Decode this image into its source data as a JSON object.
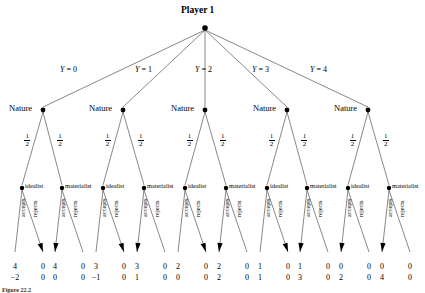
{
  "figure": {
    "title": "Player 1",
    "caption": "Figure 22.2",
    "nature_label": "Nature",
    "probability": {
      "numerator": "1",
      "denominator": "2"
    },
    "root_branch_labels": [
      "Y = 0",
      "Y = 1",
      "Y = 2",
      "Y = 3",
      "Y = 4"
    ],
    "type_labels": [
      "idealist",
      "materialist"
    ],
    "action_labels": [
      "accepts",
      "rejects"
    ],
    "colors": {
      "line": "#555555",
      "node": "#000000",
      "text": "#000000"
    }
  },
  "chart_data": {
    "type": "diagram",
    "title": "Player 1",
    "root": {
      "player": "Player 1",
      "x": 205,
      "y": 28
    },
    "root_branches": [
      {
        "label": "Y = 0",
        "value": 0,
        "child_x": 43
      },
      {
        "label": "Y = 1",
        "value": 1,
        "child_x": 123
      },
      {
        "label": "Y = 2",
        "value": 2,
        "child_x": 205
      },
      {
        "label": "Y = 3",
        "value": 3,
        "child_x": 287
      },
      {
        "label": "Y = 4",
        "value": 4,
        "child_x": 368
      }
    ],
    "nature_nodes": [
      {
        "x": 43,
        "y": 110,
        "children_x": [
          22,
          62
        ]
      },
      {
        "x": 123,
        "y": 110,
        "children_x": [
          103,
          144
        ]
      },
      {
        "x": 205,
        "y": 110,
        "children_x": [
          185,
          226
        ]
      },
      {
        "x": 287,
        "y": 110,
        "children_x": [
          267,
          307
        ]
      },
      {
        "x": 368,
        "y": 110,
        "children_x": [
          348,
          389
        ]
      }
    ],
    "decision_nodes": [
      {
        "x": 22,
        "y": 188,
        "type": "idealist",
        "arrow_on": "rejects"
      },
      {
        "x": 62,
        "y": 188,
        "type": "materialist",
        "arrow_on": "accepts"
      },
      {
        "x": 103,
        "y": 188,
        "type": "idealist",
        "arrow_on": "rejects"
      },
      {
        "x": 144,
        "y": 188,
        "type": "materialist",
        "arrow_on": "accepts"
      },
      {
        "x": 185,
        "y": 188,
        "type": "idealist",
        "arrow_on": "rejects"
      },
      {
        "x": 226,
        "y": 188,
        "type": "materialist",
        "arrow_on": "accepts"
      },
      {
        "x": 267,
        "y": 188,
        "type": "idealist",
        "arrow_on": "rejects"
      },
      {
        "x": 307,
        "y": 188,
        "type": "materialist",
        "arrow_on": "accepts"
      },
      {
        "x": 348,
        "y": 188,
        "type": "idealist",
        "arrow_on": "accepts"
      },
      {
        "x": 389,
        "y": 188,
        "type": "materialist",
        "arrow_on": "accepts"
      }
    ],
    "terminal_payoffs": [
      {
        "x": 8,
        "top": "4",
        "bottom": "−2",
        "action": "accepts",
        "type": "idealist",
        "Y": 0
      },
      {
        "x": 36,
        "top": "0",
        "bottom": "0",
        "action": "rejects",
        "type": "idealist",
        "Y": 0
      },
      {
        "x": 48,
        "top": "4",
        "bottom": "0",
        "action": "accepts",
        "type": "materialist",
        "Y": 0
      },
      {
        "x": 76,
        "top": "0",
        "bottom": "0",
        "action": "rejects",
        "type": "materialist",
        "Y": 0
      },
      {
        "x": 89,
        "top": "3",
        "bottom": "−1",
        "action": "accepts",
        "type": "idealist",
        "Y": 1
      },
      {
        "x": 117,
        "top": "0",
        "bottom": "0",
        "action": "rejects",
        "type": "idealist",
        "Y": 1
      },
      {
        "x": 130,
        "top": "3",
        "bottom": "1",
        "action": "accepts",
        "type": "materialist",
        "Y": 1
      },
      {
        "x": 158,
        "top": "0",
        "bottom": "0",
        "action": "rejects",
        "type": "materialist",
        "Y": 1
      },
      {
        "x": 171,
        "top": "2",
        "bottom": "0",
        "action": "accepts",
        "type": "idealist",
        "Y": 2
      },
      {
        "x": 199,
        "top": "0",
        "bottom": "0",
        "action": "rejects",
        "type": "idealist",
        "Y": 2
      },
      {
        "x": 212,
        "top": "2",
        "bottom": "2",
        "action": "accepts",
        "type": "materialist",
        "Y": 2
      },
      {
        "x": 240,
        "top": "0",
        "bottom": "0",
        "action": "rejects",
        "type": "materialist",
        "Y": 2
      },
      {
        "x": 253,
        "top": "1",
        "bottom": "1",
        "action": "accepts",
        "type": "idealist",
        "Y": 3
      },
      {
        "x": 281,
        "top": "0",
        "bottom": "0",
        "action": "rejects",
        "type": "idealist",
        "Y": 3
      },
      {
        "x": 293,
        "top": "1",
        "bottom": "3",
        "action": "accepts",
        "type": "materialist",
        "Y": 3
      },
      {
        "x": 321,
        "top": "0",
        "bottom": "0",
        "action": "rejects",
        "type": "materialist",
        "Y": 3
      },
      {
        "x": 334,
        "top": "0",
        "bottom": "2",
        "action": "accepts",
        "type": "idealist",
        "Y": 4
      },
      {
        "x": 362,
        "top": "0",
        "bottom": "0",
        "action": "rejects",
        "type": "idealist",
        "Y": 4
      },
      {
        "x": 375,
        "top": "0",
        "bottom": "4",
        "action": "accepts",
        "type": "materialist",
        "Y": 4
      },
      {
        "x": 403,
        "top": "0",
        "bottom": "0",
        "action": "rejects",
        "type": "materialist",
        "Y": 4
      }
    ],
    "payoff_row_top_y": 262,
    "payoff_row_bottom_y": 273,
    "terminal_y": 252
  }
}
